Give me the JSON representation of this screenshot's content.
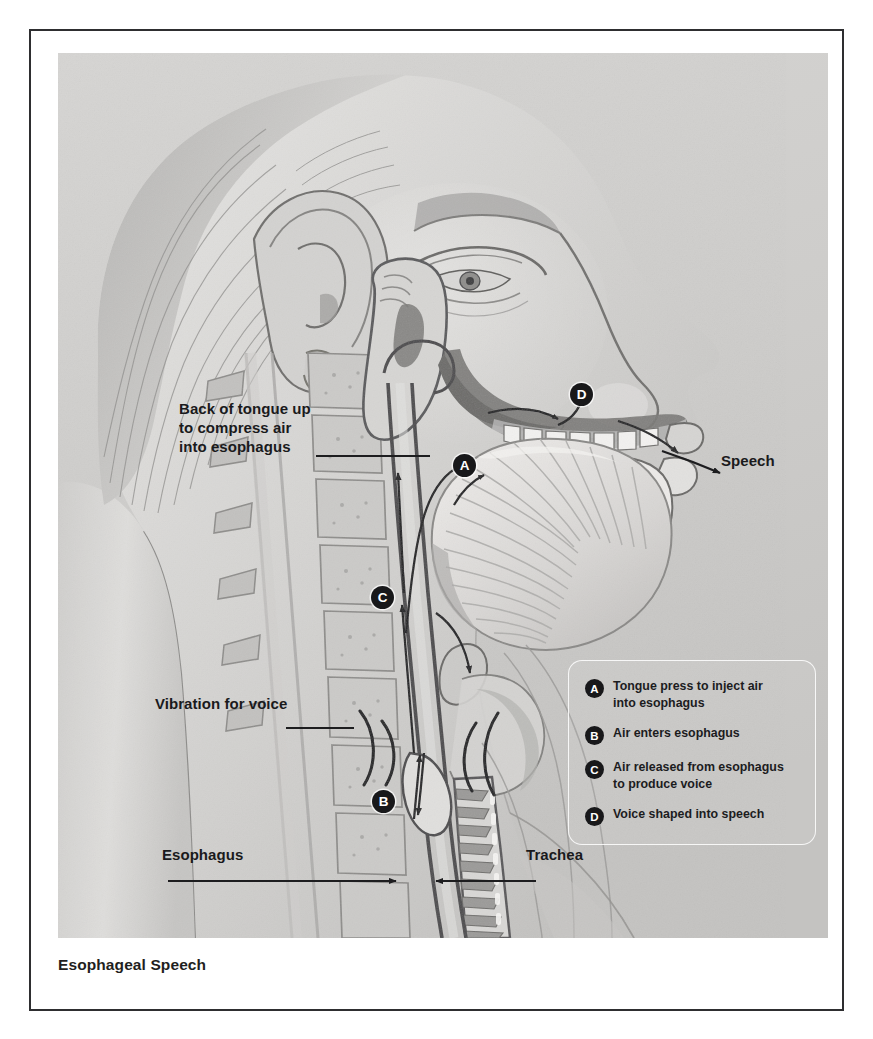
{
  "caption": "Esophageal Speech",
  "callouts": [
    {
      "id": "tongue",
      "text": "Back of tongue up\nto compress air\ninto esophagus"
    },
    {
      "id": "vibration",
      "text": "Vibration for voice"
    },
    {
      "id": "speech",
      "text": "Speech"
    },
    {
      "id": "esophagus",
      "text": "Esophagus"
    },
    {
      "id": "trachea",
      "text": "Trachea"
    }
  ],
  "markers": [
    {
      "letter": "A"
    },
    {
      "letter": "B"
    },
    {
      "letter": "C"
    },
    {
      "letter": "D"
    }
  ],
  "legend": {
    "items": [
      {
        "letter": "A",
        "text": "Tongue press to inject air\ninto esophagus"
      },
      {
        "letter": "B",
        "text": "Air enters esophagus"
      },
      {
        "letter": "C",
        "text": "Air released from esophagus\nto produce voice"
      },
      {
        "letter": "D",
        "text": "Voice shaped into speech"
      }
    ]
  },
  "colors": {
    "frame": "#2e2e30",
    "text": "#1a1a1c",
    "marker_fill": "#18181a",
    "marker_text": "#ffffff",
    "plate_background": "#cfcfcf",
    "skin_light": "#e3e2e0",
    "skin_mid": "#c9c8c6",
    "skin_shadow": "#a6a5a3",
    "mucosa_dark": "#6f6e6d",
    "cartilage": "#b9b8b6",
    "airway_line": "#3a3a3c"
  }
}
